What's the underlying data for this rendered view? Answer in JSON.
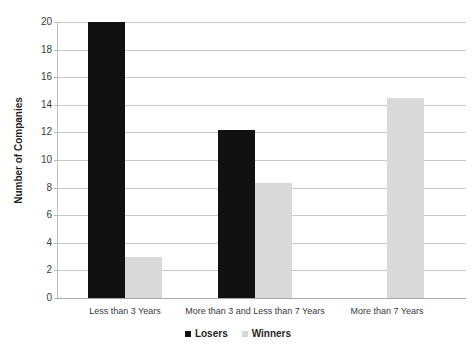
{
  "chart_data": {
    "type": "bar",
    "title": "",
    "xlabel": "",
    "ylabel": "Number of Companies",
    "ylim": [
      0,
      20
    ],
    "ytick_step": 2,
    "yticks": [
      "20",
      "18",
      "16",
      "14",
      "12",
      "10",
      "8",
      "6",
      "4",
      "2",
      "0"
    ],
    "grid": true,
    "legend_position": "bottom",
    "categories": [
      "Less than 3 Years",
      "More than 3 and Less than 7 Years",
      "More than 7 Years"
    ],
    "series": [
      {
        "name": "Losers",
        "color": "#111111",
        "values": [
          20,
          12.2,
          0
        ]
      },
      {
        "name": "Winners",
        "color": "#d9d9d9",
        "values": [
          3,
          8.3,
          14.5
        ]
      }
    ]
  }
}
